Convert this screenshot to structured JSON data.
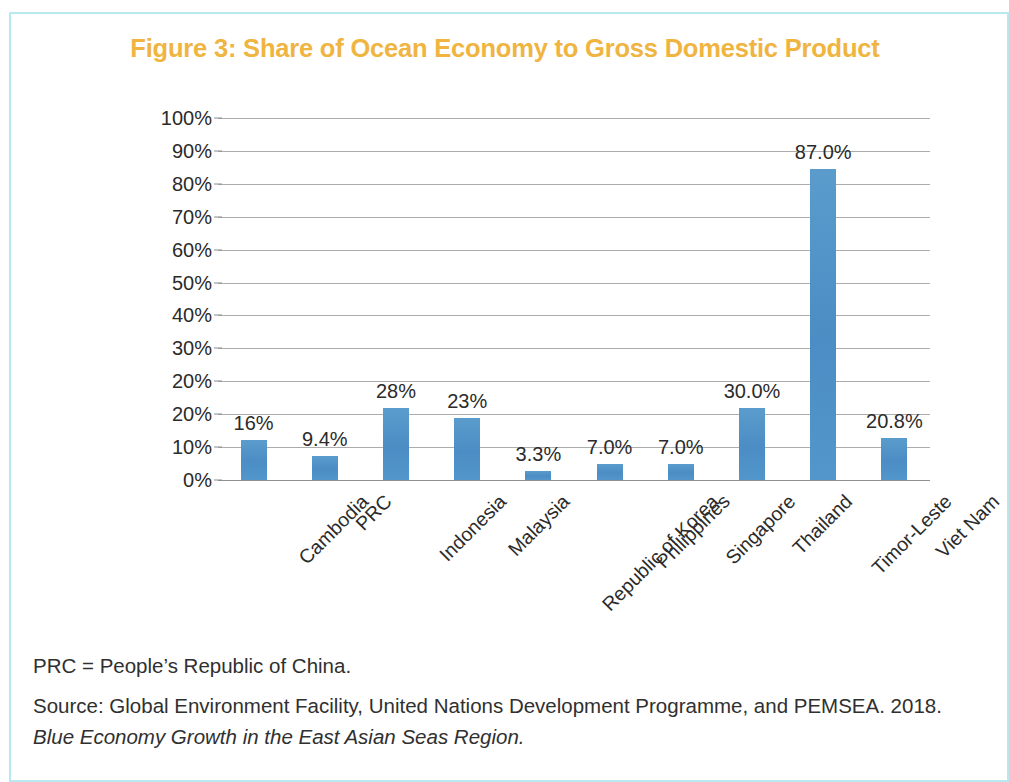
{
  "figure": {
    "title": "Figure 3: Share of Ocean Economy to Gross Domestic Product",
    "title_color": "#f0b441",
    "frame_color": "#b8e8f0"
  },
  "notes": {
    "abbreviation": "PRC = People’s Republic of China.",
    "source": "Source: Global Environment Facility, United Nations Development Programme, and PEMSEA. 2018.",
    "source_title_italic": "Blue Economy Growth in the East Asian Seas Region."
  },
  "chart_data": {
    "type": "bar",
    "title": "Figure 3: Share of Ocean Economy to Gross Domestic Product",
    "xlabel": "",
    "ylabel": "",
    "ylim": [
      0,
      100
    ],
    "grid": true,
    "legend": "none",
    "bar_color": "#4f93c8",
    "categories": [
      "Cambodia",
      "PRC",
      "Indonesia",
      "Malaysia",
      "Republic of Korea",
      "Philippines",
      "Singapore",
      "Thailand",
      "Timor-Leste",
      "Viet Nam"
    ],
    "values": [
      16,
      9.4,
      28,
      23,
      3.3,
      7.0,
      7.0,
      30.0,
      87.0,
      20.8
    ],
    "data_labels": [
      "16%",
      "9.4%",
      "28%",
      "23%",
      "3.3%",
      "7.0%",
      "7.0%",
      "30.0%",
      "87.0%",
      "20.8%"
    ],
    "plotted_heights_percent": [
      11,
      6.5,
      20,
      17,
      2.5,
      4.5,
      4.5,
      20,
      86,
      11.5
    ],
    "ytick_labels": [
      "100%",
      "90%",
      "80%",
      "70%",
      "60%",
      "50%",
      "40%",
      "30%",
      "20%",
      "20%",
      "10%",
      "0%"
    ],
    "ytick_values": [
      100,
      90,
      80,
      70,
      60,
      50,
      40,
      30,
      20,
      20,
      10,
      0
    ]
  }
}
